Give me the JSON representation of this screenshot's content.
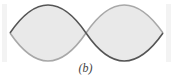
{
  "figure": {
    "caption": "(b)",
    "nodes": 3,
    "antinodes": 2,
    "colors": {
      "fill": "#e9e9e9",
      "curve_dark": "#555555",
      "curve_light": "#a8a8a8",
      "wall": "#f3f3f3"
    }
  }
}
